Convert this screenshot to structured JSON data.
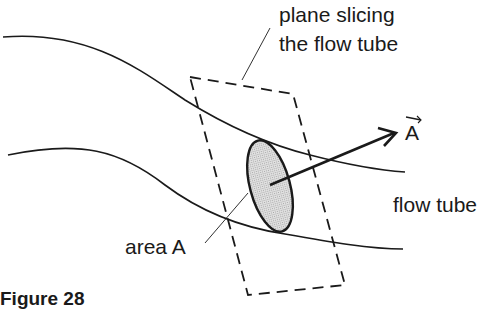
{
  "figure": {
    "caption": "Figure 28",
    "labels": {
      "plane_line1": "plane slicing",
      "plane_line2": "the flow tube",
      "vector": "A",
      "flow_tube": "flow tube",
      "area": "area A"
    },
    "colors": {
      "stroke": "#1a1a1a",
      "area_fill": "#d4d4d4"
    }
  }
}
